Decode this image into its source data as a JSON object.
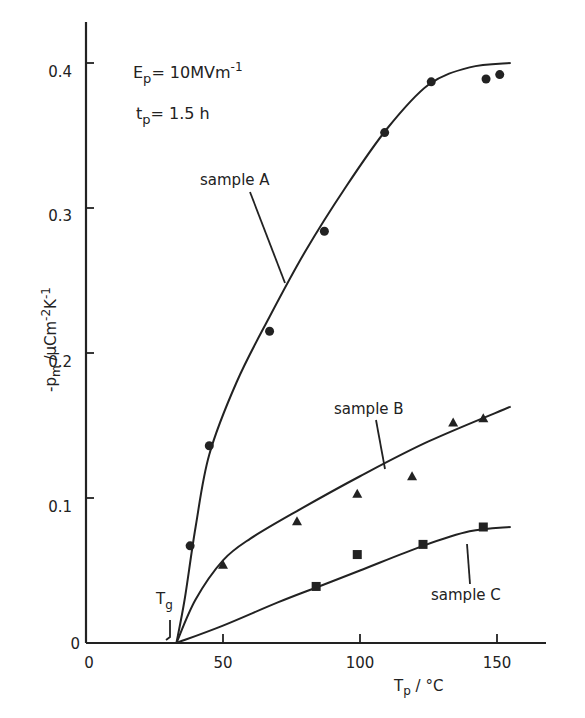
{
  "chart_data": {
    "type": "scatter",
    "title": "",
    "xlabel": "Tp / °C",
    "ylabel": "-pm / μCm-2K-1",
    "xlim": [
      0,
      165
    ],
    "ylim": [
      0,
      0.43
    ],
    "x_ticks": [
      "0",
      "50",
      "100",
      "150"
    ],
    "y_ticks": [
      "0",
      "0.1",
      "0.2",
      "0.3",
      "0.4"
    ],
    "grid": false,
    "annotations": [
      "Ep = 10 MVm-1",
      "tp = 1.5 h",
      "Tg",
      "sample A",
      "sample B",
      "sample C"
    ],
    "series": [
      {
        "name": "sample A",
        "marker": "circle",
        "x": [
          38,
          45,
          67,
          87,
          109,
          126,
          146,
          151
        ],
        "y": [
          0.067,
          0.136,
          0.215,
          0.284,
          0.352,
          0.387,
          0.389,
          0.392
        ],
        "curve_x": [
          33,
          36,
          40,
          45,
          55,
          67,
          80,
          95,
          110,
          125,
          140,
          155
        ],
        "curve_y": [
          0,
          0.03,
          0.08,
          0.13,
          0.18,
          0.225,
          0.27,
          0.315,
          0.355,
          0.385,
          0.397,
          0.4
        ]
      },
      {
        "name": "sample B",
        "marker": "triangle",
        "x": [
          50,
          77,
          99,
          119,
          134,
          145
        ],
        "y": [
          0.054,
          0.084,
          0.103,
          0.115,
          0.152,
          0.155
        ],
        "curve_x": [
          33,
          40,
          50,
          60,
          77,
          100,
          125,
          155
        ],
        "curve_y": [
          0,
          0.03,
          0.057,
          0.072,
          0.091,
          0.115,
          0.139,
          0.163
        ]
      },
      {
        "name": "sample C",
        "marker": "square",
        "x": [
          84,
          99,
          123,
          145
        ],
        "y": [
          0.039,
          0.061,
          0.068,
          0.08
        ],
        "curve_x": [
          33,
          50,
          70,
          85,
          100,
          123,
          140,
          155
        ],
        "curve_y": [
          0,
          0.012,
          0.028,
          0.039,
          0.05,
          0.067,
          0.077,
          0.08
        ]
      }
    ]
  },
  "labels": {
    "ep": "E",
    "ep_sub": "p",
    "ep_val": "= 10MVm",
    "ep_sup": "-1",
    "tp": "t",
    "tp_sub": "p",
    "tp_val": "= 1.5 h",
    "tg": "T",
    "tg_sub": "g",
    "sample_a": "sample A",
    "sample_b": "sample B",
    "sample_c": "sample C",
    "xlabel_main": "T",
    "xlabel_sub": "p",
    "xlabel_unit": " / °C",
    "ylabel": "-p",
    "ylabel_sub": "m",
    "ylabel_unit": " /μCm",
    "ylabel_sup": "-2",
    "ylabel_unit2": "K",
    "ylabel_sup2": "-1",
    "x0": "0",
    "x50": "50",
    "x100": "100",
    "x150": "150",
    "y0": "0",
    "y01": "0.1",
    "y02": "0.2",
    "y03": "0.3",
    "y04": "0.4"
  }
}
